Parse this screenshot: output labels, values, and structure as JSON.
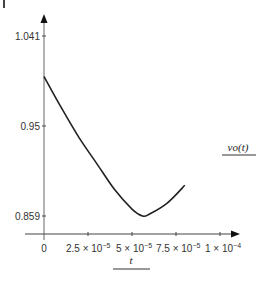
{
  "chart_data": {
    "type": "line",
    "title": "",
    "xlabel": "t",
    "ylabel": "vo(t)",
    "xlim": [
      -8e-06,
      0.000105
    ],
    "ylim": [
      0.839,
      1.051
    ],
    "x_ticks": [
      0,
      2.5e-05,
      5e-05,
      7.5e-05,
      0.0001
    ],
    "x_tick_labels": [
      "0",
      "2.5 × 10⁻⁵",
      "5 × 10⁻⁵",
      "7.5 × 10⁻⁵",
      "1 × 10⁻⁴"
    ],
    "y_ticks": [
      0.859,
      0.95,
      1.041
    ],
    "y_tick_labels": [
      "0.859",
      "0.95",
      "1.041"
    ],
    "grid": false,
    "legend": "none",
    "series": [
      {
        "name": "vo(t)",
        "color": "#222222",
        "x": [
          0,
          1e-05,
          2e-05,
          3e-05,
          4e-05,
          5e-05,
          5.6e-05,
          6e-05,
          7e-05,
          8e-05
        ],
        "values": [
          1.0,
          0.968,
          0.938,
          0.912,
          0.886,
          0.866,
          0.859,
          0.861,
          0.872,
          0.89
        ]
      }
    ]
  },
  "labels": {
    "y_title": "vo(t)",
    "x_title": "t",
    "x_ticks": [
      "0",
      "2.5 × 10",
      "5 × 10",
      "7.5 × 10",
      "1 × 10"
    ],
    "x_exps": [
      "",
      "−5",
      "−5",
      "−5",
      "−4"
    ],
    "y_ticks": [
      "1.041",
      "0.95",
      "0.859"
    ]
  }
}
